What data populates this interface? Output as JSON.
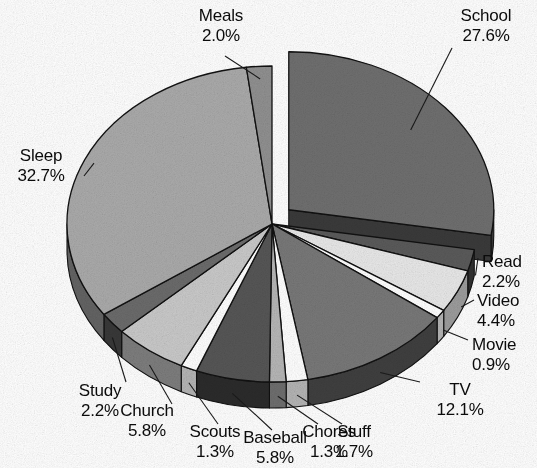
{
  "chart_data": {
    "type": "pie",
    "title": "",
    "subtitle": "",
    "xlabel": "",
    "ylabel": "",
    "legend_position": "none",
    "labels_show_percent": true,
    "exploded_slices": [
      "School"
    ],
    "style": "3d-exploded-grayscale",
    "categories": [
      "School",
      "Read",
      "Video",
      "Movie",
      "TV",
      "Stuff",
      "Chores",
      "Baseball",
      "Scouts",
      "Church",
      "Study",
      "Sleep",
      "Meals"
    ],
    "values": [
      27.6,
      2.2,
      4.4,
      0.9,
      12.1,
      1.7,
      1.3,
      5.8,
      1.3,
      5.8,
      2.2,
      32.7,
      2.0
    ],
    "units": "percent",
    "total": 100.0,
    "slices": [
      {
        "name": "School",
        "percent": "27.6%",
        "value": 27.6,
        "color": "#6f6f6f",
        "side_color": "#3a3a3a",
        "exploded": true
      },
      {
        "name": "Read",
        "percent": "2.2%",
        "value": 2.2,
        "color": "#5a5a5a",
        "side_color": "#303030",
        "exploded": false
      },
      {
        "name": "Video",
        "percent": "4.4%",
        "value": 4.4,
        "color": "#e8e8e8",
        "side_color": "#9c9c9c",
        "exploded": false
      },
      {
        "name": "Movie",
        "percent": "0.9%",
        "value": 0.9,
        "color": "#ffffff",
        "side_color": "#b4b4b4",
        "exploded": false
      },
      {
        "name": "TV",
        "percent": "12.1%",
        "value": 12.1,
        "color": "#787878",
        "side_color": "#3f3f3f",
        "exploded": false
      },
      {
        "name": "Stuff",
        "percent": "1.7%",
        "value": 1.7,
        "color": "#ffffff",
        "side_color": "#b4b4b4",
        "exploded": false
      },
      {
        "name": "Chores",
        "percent": "1.3%",
        "value": 1.3,
        "color": "#b6b6b6",
        "side_color": "#6e6e6e",
        "exploded": false
      },
      {
        "name": "Baseball",
        "percent": "5.8%",
        "value": 5.8,
        "color": "#565656",
        "side_color": "#2b2b2b",
        "exploded": false
      },
      {
        "name": "Scouts",
        "percent": "1.3%",
        "value": 1.3,
        "color": "#ffffff",
        "side_color": "#b4b4b4",
        "exploded": false
      },
      {
        "name": "Church",
        "percent": "5.8%",
        "value": 5.8,
        "color": "#c9c9c9",
        "side_color": "#7d7d7d",
        "exploded": false
      },
      {
        "name": "Study",
        "percent": "2.2%",
        "value": 2.2,
        "color": "#6b6b6b",
        "side_color": "#383838",
        "exploded": false
      },
      {
        "name": "Sleep",
        "percent": "32.7%",
        "value": 32.7,
        "color": "#aaaaaa",
        "side_color": "#636363",
        "exploded": false
      },
      {
        "name": "Meals",
        "percent": "2.0%",
        "value": 2.0,
        "color": "#909090",
        "side_color": "#4c4c4c",
        "exploded": false
      }
    ]
  },
  "labels": {
    "meals": {
      "name": "Meals",
      "pct": "2.0%"
    },
    "school": {
      "name": "School",
      "pct": "27.6%"
    },
    "sleep": {
      "name": "Sleep",
      "pct": "32.7%"
    },
    "read": {
      "name": "Read",
      "pct": "2.2%"
    },
    "video": {
      "name": "Video",
      "pct": "4.4%"
    },
    "movie": {
      "name": "Movie",
      "pct": "0.9%"
    },
    "tv": {
      "name": "TV",
      "pct": "12.1%"
    },
    "study": {
      "name": "Study",
      "pct": "2.2%"
    },
    "church": {
      "name": "Church",
      "pct": "5.8%"
    },
    "scouts": {
      "name": "Scouts",
      "pct": "1.3%"
    },
    "baseball": {
      "name": "Baseball",
      "pct": "5.8%"
    },
    "chores": {
      "name": "Chores",
      "pct": "1.3%"
    },
    "stuff": {
      "name": "Stuff",
      "pct": "1.7%"
    }
  }
}
